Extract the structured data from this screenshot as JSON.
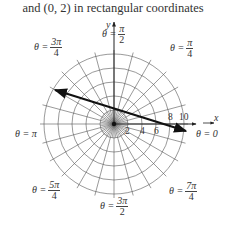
{
  "caption": "and (0, 2) in rectangular coordinates",
  "diagram": {
    "type": "polar-grid",
    "center_px": [
      114,
      124
    ],
    "px_per_unit": 7,
    "circles_r": [
      2,
      4,
      6,
      8,
      10
    ],
    "spoke_step": "pi/12",
    "axes": {
      "x_label": "x",
      "y_label": "y"
    },
    "radial_ticks": [
      {
        "value": "2",
        "pos": "below"
      },
      {
        "value": "4",
        "pos": "below"
      },
      {
        "value": "6",
        "pos": "below"
      },
      {
        "value": "8",
        "pos": "above"
      },
      {
        "value": "10",
        "pos": "above"
      }
    ],
    "angle_labels": {
      "theta0": {
        "prefix": "θ = 0"
      },
      "theta_pi_4": {
        "prefix": "θ =",
        "num": "π",
        "den": "4"
      },
      "theta_pi_2": {
        "prefix": "θ =",
        "num": "π",
        "den": "2"
      },
      "theta_3pi_4": {
        "prefix": "θ =",
        "num": "3π",
        "den": "4"
      },
      "theta_pi": {
        "prefix": "θ = π"
      },
      "theta_5pi_4": {
        "prefix": "θ =",
        "num": "5π",
        "den": "4"
      },
      "theta_3pi_2": {
        "prefix": "θ =",
        "num": "3π",
        "den": "2"
      },
      "theta_7pi_4": {
        "prefix": "θ =",
        "num": "7π",
        "den": "4"
      }
    },
    "line": {
      "description": "Line through (6, 0) and (0, 2), arrows both ends",
      "equation": "x + 3y = 6",
      "from_px": [
        55,
        90
      ],
      "to_px": [
        186,
        131
      ],
      "color": "#111111"
    },
    "grid_color": "#555555"
  }
}
